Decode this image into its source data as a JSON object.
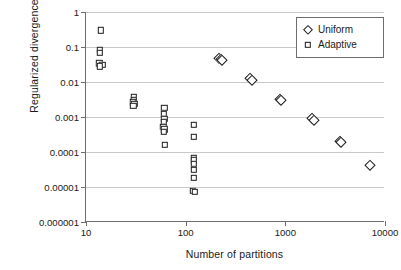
{
  "chart_data": {
    "type": "scatter",
    "title": "",
    "xlabel": "Number of partitions",
    "ylabel": "Regularized divergence",
    "xscale": "log",
    "yscale": "log",
    "xlim": [
      10,
      10000
    ],
    "ylim": [
      1e-06,
      1
    ],
    "grid": "horizontal",
    "legend_position": "top-right",
    "xticks": [
      10,
      100,
      1000,
      10000
    ],
    "xtick_labels": [
      "10",
      "100",
      "1000",
      "10000"
    ],
    "yticks": [
      1,
      0.1,
      0.01,
      0.001,
      0.0001,
      1e-05,
      1e-06
    ],
    "ytick_labels": [
      "1",
      "0.1",
      "0.01",
      "0.001",
      "0.0001",
      "0.00001",
      "0.000001"
    ],
    "series": [
      {
        "name": "Uniform",
        "marker": "diamond",
        "color": "#1a1a1a",
        "points": [
          [
            215,
            0.05
          ],
          [
            228,
            0.046
          ],
          [
            232,
            0.043
          ],
          [
            445,
            0.0128
          ],
          [
            462,
            0.0115
          ],
          [
            880,
            0.0033
          ],
          [
            900,
            0.003
          ],
          [
            1850,
            0.00092
          ],
          [
            1950,
            0.00082
          ],
          [
            3550,
            0.00021
          ],
          [
            3650,
            0.00019
          ],
          [
            7000,
            4.2e-05
          ]
        ]
      },
      {
        "name": "Adaptive",
        "marker": "square",
        "color": "#1a1a1a",
        "points": [
          [
            14,
            0.3
          ],
          [
            13.8,
            0.082
          ],
          [
            13.8,
            0.068
          ],
          [
            13.6,
            0.034
          ],
          [
            14.6,
            0.031
          ],
          [
            13.8,
            0.028
          ],
          [
            30,
            0.0038
          ],
          [
            30,
            0.0031
          ],
          [
            29.5,
            0.0026
          ],
          [
            30.5,
            0.0024
          ],
          [
            29.8,
            0.0021
          ],
          [
            61,
            0.00185
          ],
          [
            60,
            0.00125
          ],
          [
            61,
            0.00088
          ],
          [
            60.5,
            0.00072
          ],
          [
            59.5,
            0.00052
          ],
          [
            61,
            0.00044
          ],
          [
            60,
            0.00038
          ],
          [
            62,
            0.00016
          ],
          [
            121,
            0.00059
          ],
          [
            121,
            0.00027
          ],
          [
            120,
            6.8e-05
          ],
          [
            120,
            5.8e-05
          ],
          [
            120,
            4.6e-05
          ],
          [
            120,
            3.1e-05
          ],
          [
            120,
            1.85e-05
          ],
          [
            118,
            7.7e-06
          ],
          [
            124,
            7.4e-06
          ]
        ]
      }
    ]
  },
  "legend": {
    "items": [
      {
        "label": "Uniform",
        "marker": "diamond"
      },
      {
        "label": "Adaptive",
        "marker": "square"
      }
    ]
  }
}
